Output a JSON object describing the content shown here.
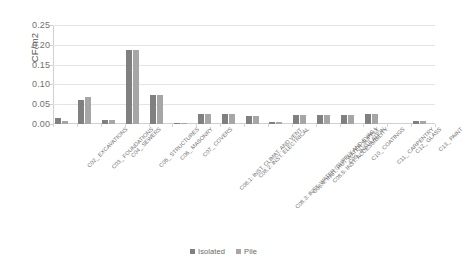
{
  "chart_data": {
    "type": "bar",
    "title": "",
    "xlabel": "",
    "ylabel": "CF/m2",
    "ylim": [
      0,
      0.25
    ],
    "yticks": [
      "0.00",
      "0.05",
      "0.10",
      "0.15",
      "0.20",
      "0.25"
    ],
    "ytick_values": [
      0,
      0.05,
      0.1,
      0.15,
      0.2,
      0.25
    ],
    "grid": "horizontal",
    "legend_position": "bottom",
    "categories": [
      "C02_ EXCAVATIONS",
      "C03_ FOUNDATIONS",
      "C04_ SEWERS",
      "C05_ STRUCTURES",
      "C06_ MASONRY",
      "C07_ COVERS",
      "C08.1: INST. CLIMAT. AND VENT.",
      "C08.2: INST. ELECTRICAL",
      "C08.3: INST. WATER (SUPPLY AND EVAC.)",
      "C08.4: INST. HOT WATER SUPPLY",
      "C08.5: INST. ACCESSIBILITY",
      "C09_ INSULATION",
      "C10_ COATINGS",
      "C11_ CARPENTRY",
      "C12_ GLASS",
      "C13_ PAINT"
    ],
    "series": [
      {
        "name": "Isolated",
        "color": "#808080",
        "values": [
          0.015,
          0.06,
          0.01,
          0.186,
          0.074,
          0.002,
          0.026,
          0.026,
          0.02,
          0.004,
          0.024,
          0.024,
          0.024,
          0.026,
          0.0,
          0.008
        ]
      },
      {
        "name": "Pile",
        "color": "#a6a6a6",
        "values": [
          0.008,
          0.069,
          0.01,
          0.186,
          0.074,
          0.002,
          0.026,
          0.026,
          0.02,
          0.004,
          0.024,
          0.024,
          0.024,
          0.026,
          0.0,
          0.008
        ]
      }
    ]
  },
  "legend": {
    "items": [
      {
        "label": "Isolated",
        "color": "#808080"
      },
      {
        "label": "Pile",
        "color": "#a6a6a6"
      }
    ]
  }
}
